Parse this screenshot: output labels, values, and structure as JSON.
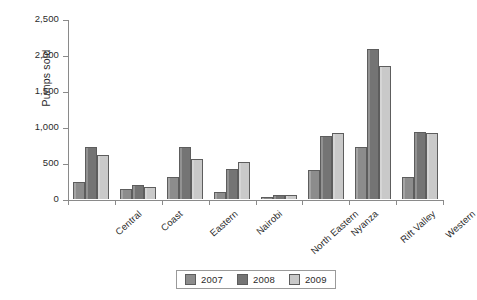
{
  "chart_data": {
    "type": "bar",
    "title": "",
    "subtitle": "",
    "xlabel": "",
    "ylabel": "Pumps sold",
    "ylim": [
      0,
      2500
    ],
    "ytick_values": [
      0,
      500,
      1000,
      1500,
      2000,
      2500
    ],
    "ytick_labels": [
      "0",
      "500",
      "1,000",
      "1,500",
      "2,000",
      "2,500"
    ],
    "grid": false,
    "legend_position": "bottom",
    "categories": [
      "Central",
      "Coast",
      "Eastern",
      "Nairobi",
      "North Eastern",
      "Nyanza",
      "Rift Valley",
      "Western"
    ],
    "series": [
      {
        "name": "2007",
        "color": "#8c8c8c",
        "values": [
          240,
          140,
          300,
          100,
          30,
          400,
          725,
          300
        ]
      },
      {
        "name": "2008",
        "color": "#747474",
        "values": [
          725,
          190,
          720,
          410,
          50,
          870,
          2090,
          930
        ]
      },
      {
        "name": "2009",
        "color": "#c9c9c9",
        "values": [
          610,
          160,
          550,
          520,
          60,
          920,
          1850,
          920
        ]
      }
    ]
  },
  "legend": {
    "items": [
      {
        "label": "2007",
        "color": "#8c8c8c"
      },
      {
        "label": "2008",
        "color": "#747474"
      },
      {
        "label": "2009",
        "color": "#c9c9c9"
      }
    ]
  },
  "axis": {
    "y_axis_title": "Pumps sold"
  }
}
